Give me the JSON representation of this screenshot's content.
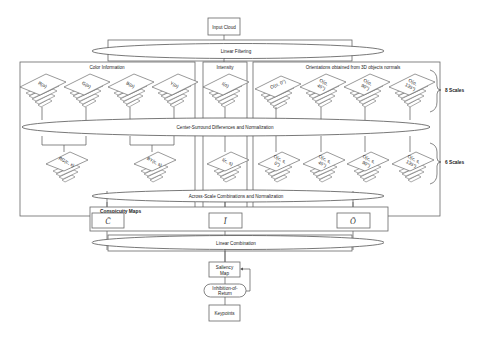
{
  "nodes": {
    "input_cloud": "Input Cloud",
    "linear_filtering": "Linear Filtering",
    "center_surround": "Center-Surround Differences and Normalization",
    "across_scale": "Across-Scale Combinations and Normalization",
    "conspicuity_maps": "Conspicuity Maps",
    "linear_combination": "Linear Combination",
    "saliency_map_line1": "Saliency",
    "saliency_map_line2": "Map",
    "inhibition_line1": "Inhibition-of-",
    "inhibition_line2": "Return",
    "keypoints": "Keypoints"
  },
  "groups": {
    "color": "Color Information",
    "intensity": "Intensity",
    "orientation": "Orientations obtained from 3D objects normals"
  },
  "scales": {
    "top": "8 Scales",
    "bottom": "6 Scales"
  },
  "pyramids_top": [
    {
      "line1": "R(σ)",
      "line2": ""
    },
    {
      "line1": "G(σ)",
      "line2": ""
    },
    {
      "line1": "B(σ)",
      "line2": ""
    },
    {
      "line1": "Y(σ)",
      "line2": ""
    },
    {
      "line1": "I(σ)",
      "line2": ""
    },
    {
      "line1": "O(σ, 0°)",
      "line2": ""
    },
    {
      "line1": "O(σ,",
      "line2": "45°)"
    },
    {
      "line1": "O(σ,",
      "line2": "90°)"
    },
    {
      "line1": "O(σ,",
      "line2": "135°)"
    }
  ],
  "pyramids_bottom": [
    {
      "line1": "RG(c, s)",
      "line2": ""
    },
    {
      "line1": "BY(c, s)",
      "line2": ""
    },
    {
      "line1": "I(c, s)",
      "line2": ""
    },
    {
      "line1": "O(c, s,",
      "line2": "0°)"
    },
    {
      "line1": "O(c, s,",
      "line2": "45°)"
    },
    {
      "line1": "O(c, s,",
      "line2": "90°)"
    },
    {
      "line1": "O(c, s,",
      "line2": "135°)"
    }
  ],
  "conspicuity": {
    "color": "C̄",
    "intensity": "Ī",
    "orientation": "Ō"
  }
}
